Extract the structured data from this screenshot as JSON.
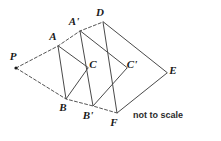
{
  "figure": {
    "note": "not to scale",
    "stroke_color": "#4a4a4a",
    "label_color": "#1a1a1a",
    "background": "#ffffff",
    "points": {
      "P": {
        "label": "P",
        "x": 16,
        "y": 68,
        "lx": 13,
        "ly": 60
      },
      "A": {
        "label": "A",
        "x": 58,
        "y": 46,
        "lx": 53,
        "ly": 40
      },
      "B": {
        "label": "B",
        "x": 66,
        "y": 99,
        "lx": 63,
        "ly": 111
      },
      "C": {
        "label": "C",
        "x": 88,
        "y": 68,
        "lx": 93,
        "ly": 68
      },
      "Ap": {
        "label": "A'",
        "x": 80,
        "y": 31,
        "lx": 74,
        "ly": 25
      },
      "Bp": {
        "label": "B'",
        "x": 93,
        "y": 106,
        "lx": 88,
        "ly": 119
      },
      "Cp": {
        "label": "C'",
        "x": 127,
        "y": 68,
        "lx": 132,
        "ly": 68
      },
      "D": {
        "label": "D",
        "x": 103,
        "y": 22,
        "lx": 100,
        "ly": 16
      },
      "E": {
        "label": "E",
        "x": 167,
        "y": 73,
        "lx": 173,
        "ly": 74
      },
      "F": {
        "label": "F",
        "x": 117,
        "y": 113,
        "lx": 114,
        "ly": 126
      }
    },
    "triangles": [
      {
        "name": "triangle-ABC",
        "vertices": [
          "A",
          "B",
          "C"
        ]
      },
      {
        "name": "triangle-ApBpCp",
        "vertices": [
          "Ap",
          "Bp",
          "Cp"
        ]
      },
      {
        "name": "triangle-DFE",
        "vertices": [
          "D",
          "F",
          "E"
        ]
      }
    ],
    "rays": [
      {
        "name": "ray-P-A-Ap-D",
        "from": "P",
        "through": [
          "A",
          "Ap",
          "D"
        ]
      },
      {
        "name": "ray-P-B-Bp-F",
        "from": "P",
        "through": [
          "B",
          "Bp",
          "F"
        ]
      }
    ],
    "note_pos": {
      "x": 158,
      "y": 118
    }
  }
}
